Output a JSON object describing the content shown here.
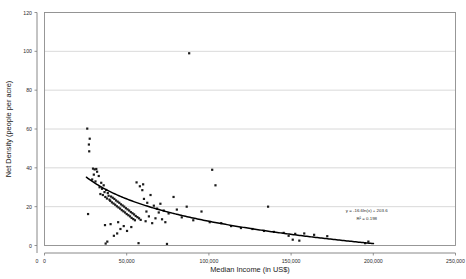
{
  "chart_data": {
    "type": "scatter",
    "title": "",
    "xlabel": "Median Income (in US$)",
    "ylabel": "Net Density (people per acre)",
    "xlim": [
      0,
      250000
    ],
    "ylim": [
      0,
      120
    ],
    "xticks": [
      0,
      50000,
      100000,
      150000,
      200000,
      250000
    ],
    "xtick_labels": [
      "0",
      "50,000",
      "100,000",
      "150,000",
      "200,000",
      "250,000"
    ],
    "yticks": [
      0,
      20,
      40,
      60,
      80,
      100,
      120
    ],
    "ytick_labels": [
      "0",
      "20",
      "40",
      "60",
      "80",
      "100",
      "120"
    ],
    "grid": "horizontal",
    "legend": "none",
    "marker": "small-filled-square",
    "marker_color": "#1b1b1b",
    "trendline": {
      "kind": "logarithmic",
      "equation": "y = -16.6ln(x) + 203.6",
      "r_squared_label": "R² = 0.198",
      "slope_coefficient": -16.6,
      "intercept": 203.6,
      "r_squared": 0.198,
      "color": "#000000"
    },
    "annotations": [
      {
        "text": "y = -16.6ln(x) + 203.6",
        "x": 196000,
        "y": 17
      },
      {
        "text": "R² = 0.198",
        "x": 196000,
        "y": 13
      }
    ],
    "points": [
      [
        26000,
        60.2
      ],
      [
        27500,
        55.0
      ],
      [
        27000,
        52.0
      ],
      [
        27200,
        48.5
      ],
      [
        29500,
        39.6
      ],
      [
        30500,
        39.2
      ],
      [
        31500,
        39.4
      ],
      [
        32000,
        38.0
      ],
      [
        30000,
        36.5
      ],
      [
        33000,
        35.8
      ],
      [
        29000,
        34.0
      ],
      [
        31000,
        33.0
      ],
      [
        34500,
        32.3
      ],
      [
        36000,
        31.0
      ],
      [
        33500,
        30.0
      ],
      [
        35000,
        29.2
      ],
      [
        37500,
        28.6
      ],
      [
        36500,
        27.5
      ],
      [
        38500,
        27.0
      ],
      [
        34000,
        26.5
      ],
      [
        35500,
        26.0
      ],
      [
        39000,
        25.6
      ],
      [
        40500,
        25.2
      ],
      [
        37000,
        25.0
      ],
      [
        41500,
        24.6
      ],
      [
        38000,
        24.2
      ],
      [
        42500,
        24.0
      ],
      [
        39500,
        23.6
      ],
      [
        43500,
        23.2
      ],
      [
        40000,
        23.0
      ],
      [
        44500,
        22.6
      ],
      [
        41000,
        22.2
      ],
      [
        45500,
        22.0
      ],
      [
        42000,
        21.6
      ],
      [
        46500,
        21.2
      ],
      [
        43000,
        21.0
      ],
      [
        47500,
        20.6
      ],
      [
        44000,
        20.2
      ],
      [
        48500,
        20.0
      ],
      [
        45000,
        19.6
      ],
      [
        49500,
        19.2
      ],
      [
        46000,
        19.0
      ],
      [
        50500,
        18.6
      ],
      [
        47000,
        18.2
      ],
      [
        51500,
        18.0
      ],
      [
        48000,
        17.6
      ],
      [
        52500,
        17.2
      ],
      [
        49000,
        17.0
      ],
      [
        53500,
        16.6
      ],
      [
        50000,
        16.2
      ],
      [
        54500,
        16.0
      ],
      [
        51000,
        15.6
      ],
      [
        55500,
        15.2
      ],
      [
        52000,
        15.0
      ],
      [
        56500,
        14.6
      ],
      [
        53000,
        14.2
      ],
      [
        57500,
        14.0
      ],
      [
        54000,
        13.6
      ],
      [
        58500,
        13.2
      ],
      [
        55000,
        13.0
      ],
      [
        26500,
        16.2
      ],
      [
        44800,
        12.0
      ],
      [
        40200,
        11.0
      ],
      [
        36800,
        10.5
      ],
      [
        48200,
        10.0
      ],
      [
        52800,
        9.5
      ],
      [
        46200,
        8.5
      ],
      [
        50200,
        7.5
      ],
      [
        44200,
        6.2
      ],
      [
        42200,
        5.0
      ],
      [
        38200,
        2.0
      ],
      [
        37200,
        1.0
      ],
      [
        57200,
        1.2
      ],
      [
        74500,
        0.8
      ],
      [
        60500,
        24.0
      ],
      [
        62500,
        22.0
      ],
      [
        64500,
        26.0
      ],
      [
        66500,
        20.5
      ],
      [
        68500,
        19.0
      ],
      [
        70500,
        21.5
      ],
      [
        72500,
        18.0
      ],
      [
        63500,
        15.0
      ],
      [
        67500,
        14.0
      ],
      [
        71500,
        13.5
      ],
      [
        61500,
        12.5
      ],
      [
        65500,
        11.5
      ],
      [
        69500,
        17.0
      ],
      [
        59500,
        28.5
      ],
      [
        58000,
        30.5
      ],
      [
        56000,
        32.5
      ],
      [
        60000,
        31.5
      ],
      [
        62000,
        17.5
      ],
      [
        73500,
        12.0
      ],
      [
        75500,
        16.5
      ],
      [
        78500,
        25.0
      ],
      [
        80500,
        18.5
      ],
      [
        83500,
        14.5
      ],
      [
        86500,
        20.0
      ],
      [
        90500,
        13.0
      ],
      [
        95500,
        17.5
      ],
      [
        100500,
        12.0
      ],
      [
        107500,
        11.5
      ],
      [
        113500,
        10.0
      ],
      [
        119500,
        9.0
      ],
      [
        126500,
        8.5
      ],
      [
        133500,
        7.5
      ],
      [
        139500,
        7.0
      ],
      [
        145500,
        6.5
      ],
      [
        152500,
        6.0
      ],
      [
        148500,
        5.0
      ],
      [
        151000,
        3.0
      ],
      [
        155000,
        2.5
      ],
      [
        158000,
        6.2
      ],
      [
        164000,
        5.5
      ],
      [
        172000,
        4.8
      ],
      [
        136000,
        20.0
      ],
      [
        104000,
        31.0
      ],
      [
        102000,
        39.0
      ],
      [
        88000,
        99.0
      ],
      [
        197000,
        2.0
      ],
      [
        195000,
        1.2
      ]
    ]
  }
}
